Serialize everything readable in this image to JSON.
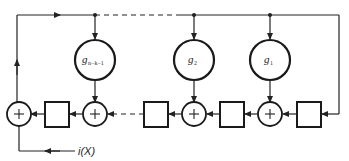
{
  "diagram": {
    "coefficients": [
      {
        "label": "g",
        "subscript": "n−k−1"
      },
      {
        "label": "g",
        "subscript": "2"
      },
      {
        "label": "g",
        "subscript": "1"
      }
    ],
    "adder_symbol": "+",
    "input_label": "i(X)",
    "colors": {
      "line": "#222222",
      "background": "#ffffff"
    }
  }
}
